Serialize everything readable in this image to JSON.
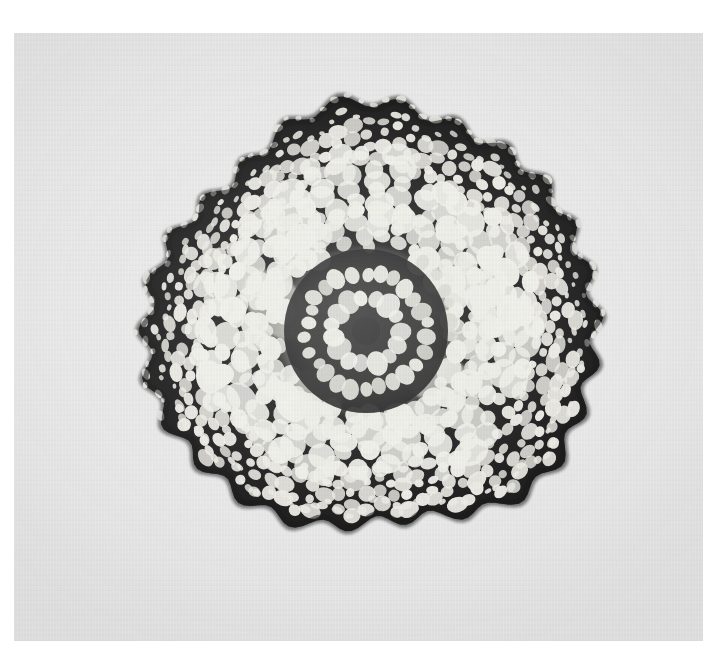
{
  "figure": {
    "kind": "light-micrograph",
    "orientation": "transverse",
    "caption": ""
  },
  "plate": {
    "background_color": "#e9e9e9",
    "page_color": "#ffffff",
    "left": 14,
    "top": 33,
    "width": 689,
    "height": 608,
    "grain": "vertical-scan-grain"
  },
  "palette": {
    "wall_dark": "#141414",
    "wall_mid": "#2b2b2b",
    "lumen_light": "#efefec",
    "lumen_mid": "#dcdcd6",
    "stele_haze": "#c9c9c2",
    "background": "#e9e9e9",
    "page": "#ffffff"
  },
  "specimen": {
    "center_x": 360,
    "center_y": 290,
    "outline_rx": 232,
    "outline_ry": 205,
    "outline_lobes": 26,
    "outline_lobe_amp": 7,
    "rotation_deg": -4,
    "zones": [
      {
        "name": "epidermis",
        "label": "Epidermis",
        "r_inner": 0.92,
        "r_outer": 1.0,
        "cell_count": 190,
        "cell_radial": 4.2,
        "cell_tangential": 3.0,
        "fill": "#e2e2dc",
        "wall": "#141414"
      },
      {
        "name": "outer-cortex",
        "label": "Outer cortex",
        "r_inner": 0.74,
        "r_outer": 0.93,
        "cell_count": 300,
        "cell_radial": 7.0,
        "cell_tangential": 6.0,
        "fill": "#eceae4",
        "wall": "#161616"
      },
      {
        "name": "mid-cortex",
        "label": "Mid cortex",
        "r_inner": 0.5,
        "r_outer": 0.76,
        "cell_count": 210,
        "cell_radial": 11.5,
        "cell_tangential": 10.5,
        "fill": "#efefe9",
        "wall": "#161616"
      },
      {
        "name": "inner-cortex",
        "label": "Inner cortex",
        "r_inner": 0.33,
        "r_outer": 0.52,
        "cell_count": 140,
        "cell_radial": 9.5,
        "cell_tangential": 9.0,
        "fill": "#edede7",
        "wall": "#1a1a1a"
      },
      {
        "name": "endodermis",
        "label": "Endodermis",
        "r_inner": 0.255,
        "r_outer": 0.345,
        "cell_count": 62,
        "cell_radial": 7.0,
        "cell_tangential": 7.5,
        "fill": "#d9d9d2",
        "wall": "#232323"
      }
    ],
    "stele": {
      "label": "Vascular stele",
      "center_x": 352,
      "center_y": 298,
      "outer_r": 82,
      "haze_r": 78,
      "haze_fill": "#cfcfc7",
      "ring_outer": {
        "label": "Pericycle ring",
        "radius": 60,
        "cell_count": 26,
        "cell_rx": 8.5,
        "cell_ry": 7.0,
        "fill": "#e6e6df"
      },
      "ring_inner": {
        "label": "Xylem rosette",
        "radius": 34,
        "cell_count": 15,
        "cell_rx": 10.0,
        "cell_ry": 8.5,
        "fill": "#eeeee8"
      },
      "core": {
        "label": "Pith core",
        "radius": 14,
        "fill": "#1b1b1b"
      }
    },
    "lacunae": [
      {
        "cx": 262,
        "cy": 272,
        "rx": 26,
        "ry": 40,
        "rot": -38,
        "fill": "#d4d4cc"
      },
      {
        "cx": 300,
        "cy": 360,
        "rx": 30,
        "ry": 22,
        "rot": 18,
        "fill": "#d8d8d0"
      },
      {
        "cx": 432,
        "cy": 256,
        "rx": 24,
        "ry": 30,
        "rot": 22,
        "fill": "#cfcfc7"
      },
      {
        "cx": 424,
        "cy": 346,
        "rx": 30,
        "ry": 20,
        "rot": -12,
        "fill": "#d2d2ca"
      }
    ]
  },
  "render": {
    "seed": 20240517,
    "blur_px": 0.35,
    "jitter": 0.38,
    "wall_stroke_outer": 3.1,
    "wall_stroke_inner": 2.4
  }
}
